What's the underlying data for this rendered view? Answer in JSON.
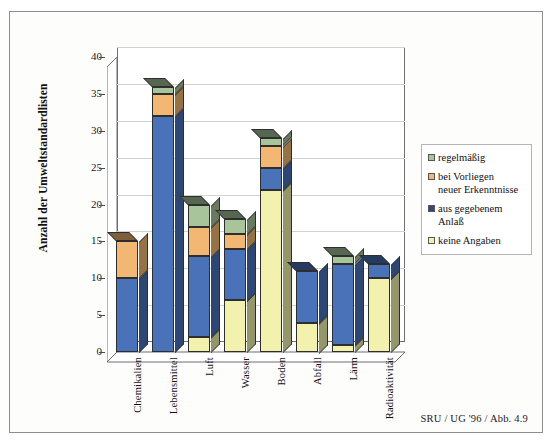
{
  "figure": {
    "source_caption": "SRU / UG '96 / Abb. 4.9"
  },
  "chart_data": {
    "type": "bar",
    "stacked": true,
    "title": "",
    "xlabel": "",
    "ylabel": "Anzahl der Umweltstandardlisten",
    "ylim": [
      0,
      40
    ],
    "ytick_step": 5,
    "yticks": [
      "0",
      "5",
      "10",
      "15",
      "20",
      "25",
      "30",
      "35",
      "40"
    ],
    "grid": true,
    "legend_position": "right",
    "categories": [
      "Chemikalien",
      "Lebensmittel",
      "Luft",
      "Wasser",
      "Boden",
      "Abfall",
      "Lärm",
      "Radioaktivität"
    ],
    "series": [
      {
        "name": "keine Angaben",
        "color": "#f2f2ae",
        "values": [
          0,
          0,
          2,
          7,
          22,
          4,
          1,
          10
        ]
      },
      {
        "name": "aus gegebenem Anlaß",
        "color": "#4a72b8",
        "values": [
          10,
          32,
          11,
          7,
          3,
          7,
          11,
          2
        ]
      },
      {
        "name": "bei Vorliegen neuer Erkenntnisse",
        "color": "#f2b873",
        "values": [
          5,
          3,
          4,
          2,
          3,
          0,
          0,
          0
        ]
      },
      {
        "name": "regelmäßig",
        "color": "#a7c49a",
        "values": [
          0,
          1,
          3,
          2,
          1,
          0,
          1,
          0
        ]
      }
    ],
    "totals": [
      15,
      36,
      20,
      18,
      29,
      11,
      13,
      12
    ]
  },
  "legend": {
    "items": [
      {
        "label": "regelmäßig",
        "color": "#a7c49a"
      },
      {
        "label": "bei Vorliegen\nneuer Erkenntnisse",
        "color": "#f2b873"
      },
      {
        "label": "aus gegebenem\nAnlaß",
        "color": "#32497f"
      },
      {
        "label": "keine Angaben",
        "color": "#f2f2ae"
      }
    ]
  }
}
